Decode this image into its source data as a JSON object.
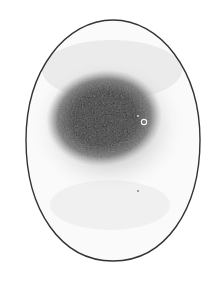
{
  "figure": {
    "background_color": "#ffffff",
    "outline_color": "#333333",
    "shading_color": "#1a1a1a",
    "highlight_color": "#f2f2f2"
  }
}
